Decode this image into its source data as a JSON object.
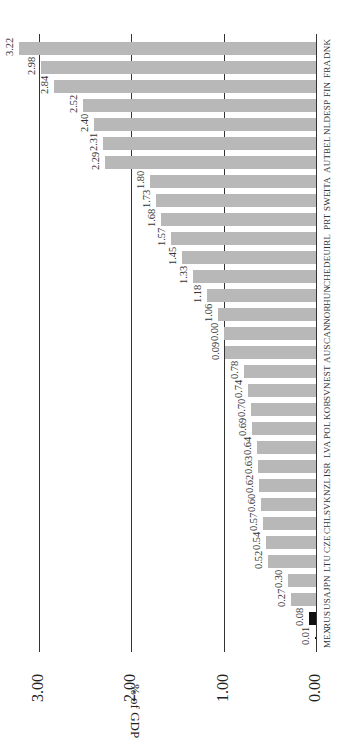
{
  "chart_data": {
    "type": "bar",
    "orientation": "horizontal (figure rotated 90°)",
    "title": "",
    "xlabel": "",
    "ylabel": "% of GDP",
    "ylim": [
      0,
      3.3
    ],
    "ticks": [
      {
        "value": 0,
        "label": "0.00"
      },
      {
        "value": 1,
        "label": "1.00"
      },
      {
        "value": 2,
        "label": "2.00"
      },
      {
        "value": 3,
        "label": "3.00"
      }
    ],
    "grid": true,
    "legend": null,
    "highlight_color": "#111111",
    "bar_color": "#b8b8b8",
    "categories": [
      "DNK",
      "FRA",
      "FIN",
      "ESP",
      "NLD",
      "BEL",
      "AUT",
      "ITA",
      "SWE",
      "PRT",
      "IRL",
      "DEU",
      "CHE",
      "HUN",
      "NOR",
      "CAN",
      "AUS",
      "EST",
      "SVN",
      "KOR",
      "POL",
      "LVA",
      "ISR",
      "NZL",
      "SVK",
      "CHL",
      "CZE",
      "LTU",
      "JPN",
      "USA",
      "RUS",
      "MEX"
    ],
    "values": [
      3.22,
      2.98,
      2.84,
      2.52,
      2.4,
      2.31,
      2.29,
      1.8,
      1.73,
      1.68,
      1.57,
      1.45,
      1.33,
      1.18,
      1.06,
      1.0,
      0.99,
      0.78,
      0.74,
      0.7,
      0.69,
      0.64,
      0.63,
      0.62,
      0.6,
      0.57,
      0.54,
      0.52,
      0.3,
      0.27,
      0.08,
      0.01
    ],
    "value_labels": [
      "3.22",
      "2.98",
      "2.84",
      "2.52",
      "2.40",
      "2.31",
      "2.29",
      "1.80",
      "1.73",
      "1.68",
      "1.57",
      "1.45",
      "1.33",
      "1.18",
      "1.06",
      "0.00",
      "0.09",
      "0.78",
      "0.74",
      "0.70",
      "0.69",
      "0.64",
      "0.63",
      "0.62",
      "0.60",
      "0.57",
      "0.54",
      "0.52",
      "0.30",
      "0.27",
      "0.08",
      "0.01"
    ],
    "highlighted": [
      "RUS",
      "MEX"
    ]
  }
}
